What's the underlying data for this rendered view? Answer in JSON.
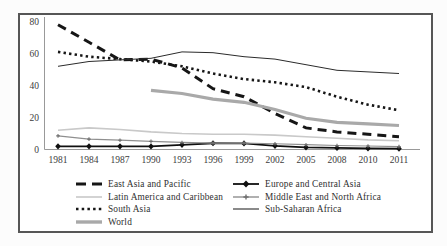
{
  "figure": {
    "border_color": "#565656",
    "background": "#ffffff",
    "axis_color": "#999999",
    "tick_text_color": "#3c3c3c"
  },
  "chart_data": {
    "type": "line",
    "title": "",
    "xlabel": "",
    "ylabel": "",
    "x": [
      "1981",
      "1984",
      "1987",
      "1990",
      "1993",
      "1996",
      "1999",
      "2002",
      "2005",
      "2008",
      "2010",
      "2011"
    ],
    "ylim": [
      0,
      80
    ],
    "yticks": [
      0,
      20,
      40,
      60,
      80
    ],
    "grid": false,
    "legend_position": "bottom-inside",
    "series": [
      {
        "name": "East Asia and Pacific",
        "values": [
          78,
          67,
          56,
          56.5,
          51,
          38,
          33,
          22.5,
          13.5,
          11,
          9.5,
          8
        ],
        "color": "#161616",
        "line": "dashed",
        "width": 3,
        "marker": "none"
      },
      {
        "name": "Europe and Central Asia",
        "values": [
          2,
          2,
          2,
          1.9,
          2.9,
          3.9,
          3.8,
          2.3,
          1.3,
          1,
          0.7,
          0.5
        ],
        "color": "#101010",
        "line": "solid",
        "width": 1.8,
        "marker": "diamond"
      },
      {
        "name": "Latin America and Caribbean",
        "values": [
          12,
          13.5,
          12.5,
          11,
          10,
          9.5,
          9.5,
          9,
          8,
          7,
          6,
          5.5
        ],
        "color": "#c9c9c9",
        "line": "solid",
        "width": 1.6,
        "marker": "none"
      },
      {
        "name": "Middle East and North Africa",
        "values": [
          8.5,
          6.5,
          5.8,
          5.1,
          4.4,
          4,
          4,
          3.6,
          3,
          2.5,
          2.2,
          1.8
        ],
        "color": "#8f8f8f",
        "line": "solid",
        "width": 1.2,
        "marker": "plus"
      },
      {
        "name": "South Asia",
        "values": [
          61,
          58,
          56.5,
          55,
          52,
          47.5,
          44,
          42,
          39,
          33,
          28,
          24.5
        ],
        "color": "#161616",
        "line": "dotted",
        "width": 2.6,
        "marker": "none"
      },
      {
        "name": "Sub-Saharan Africa",
        "values": [
          52,
          55,
          56,
          57,
          61,
          60.5,
          58,
          56.5,
          53,
          49.5,
          48.5,
          47.5
        ],
        "color": "#2b2b2b",
        "line": "solid",
        "width": 1,
        "marker": "none"
      },
      {
        "name": "World",
        "values": [
          null,
          null,
          null,
          37,
          35,
          31.5,
          29.5,
          25,
          19.5,
          17,
          16,
          15
        ],
        "color": "#a9a9a9",
        "line": "solid",
        "width": 3.2,
        "marker": "none"
      }
    ]
  }
}
